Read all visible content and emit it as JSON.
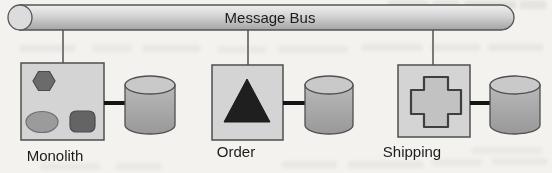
{
  "diagram": {
    "title_hint": "message-bus-architecture",
    "bus": {
      "label": "Message Bus",
      "shape": "horizontal-pipe-cylinder"
    },
    "components": [
      {
        "id": "monolith",
        "label": "Monolith",
        "inner_shapes": [
          "hexagon-icon",
          "ellipse-icon",
          "rounded-square-icon"
        ],
        "store": "database-cylinder",
        "connected_to_bus": true
      },
      {
        "id": "order",
        "label": "Order",
        "inner_shapes": [
          "triangle-icon"
        ],
        "store": "database-cylinder",
        "connected_to_bus": true
      },
      {
        "id": "shipping",
        "label": "Shipping",
        "inner_shapes": [
          "cross-icon"
        ],
        "store": "database-cylinder",
        "connected_to_bus": true
      }
    ],
    "colors": {
      "paper": "#f3f2ee",
      "box_fill": "#d4d4d4",
      "box_border": "#4f4f4f",
      "bus_cap_fill": "#dcdcdc",
      "cylinder_top_fill": "#c9c9c9",
      "hexagon_fill": "#6b6b6b",
      "ellipse_fill": "#9b9b9b",
      "rounded_square_fill": "#646464",
      "triangle_fill": "#1f1f1f",
      "cross_fill": "#c2c2c2",
      "thin_connector": "#7a7a7a",
      "thick_connector": "#141414",
      "text": "#1c1c1c"
    }
  }
}
